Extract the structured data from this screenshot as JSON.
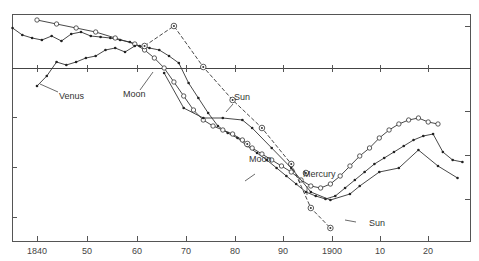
{
  "chart_data": {
    "type": "line",
    "title": "",
    "xlabel": "",
    "ylabel": "",
    "xlim": [
      1835,
      1928
    ],
    "x_ticks": [
      1840,
      1850,
      1860,
      1870,
      1880,
      1890,
      1900,
      1910,
      1920
    ],
    "x_tick_labels": [
      "1840",
      "50",
      "60",
      "70",
      "80",
      "90",
      "1900",
      "10",
      "20"
    ],
    "y_tick_labels": [],
    "grid": false,
    "reference_line": "horizontal zero line near top",
    "y_units_note": "values are relative (pixel-estimated, up = larger); y axis unlabeled",
    "series": [
      {
        "name": "Series A (dots)",
        "marker": "dot",
        "style": "solid",
        "x": [
          1835,
          1837,
          1839,
          1841,
          1843,
          1845,
          1847,
          1849,
          1851,
          1853,
          1855,
          1857,
          1859,
          1861,
          1863,
          1865,
          1867,
          1869,
          1871,
          1873,
          1875,
          1877,
          1879,
          1881,
          1883,
          1885,
          1887,
          1889,
          1891,
          1893,
          1895,
          1897,
          1899,
          1901,
          1903,
          1905,
          1907,
          1909,
          1911,
          1913,
          1915,
          1917,
          1919,
          1921,
          1923,
          1925,
          1927
        ],
        "y": [
          40,
          33,
          30,
          28,
          32,
          27,
          34,
          36,
          32,
          31,
          30,
          28,
          26,
          22,
          20,
          18,
          12,
          5,
          -15,
          -30,
          -45,
          -58,
          -65,
          -70,
          -78,
          -85,
          -92,
          -100,
          -108,
          -116,
          -124,
          -128,
          -131,
          -128,
          -120,
          -112,
          -104,
          -96,
          -90,
          -84,
          -78,
          -72,
          -68,
          -66,
          -84,
          -92,
          -94
        ]
      },
      {
        "name": "Series B (circles)",
        "marker": "circle",
        "style": "solid",
        "x": [
          1840,
          1844,
          1848,
          1852,
          1856,
          1860,
          1862,
          1864,
          1866,
          1868,
          1870,
          1872,
          1874,
          1876,
          1878,
          1880,
          1882,
          1884,
          1886,
          1888,
          1890,
          1892,
          1894,
          1896,
          1898,
          1900,
          1902,
          1904,
          1906,
          1908,
          1910,
          1912,
          1914,
          1916,
          1918,
          1920,
          1922
        ],
        "y": [
          48,
          44,
          40,
          36,
          30,
          24,
          18,
          10,
          0,
          -14,
          -28,
          -42,
          -52,
          -58,
          -62,
          -66,
          -72,
          -80,
          -86,
          -92,
          -98,
          -104,
          -112,
          -118,
          -120,
          -116,
          -108,
          -98,
          -88,
          -80,
          -70,
          -62,
          -56,
          -52,
          -50,
          -54,
          -56
        ]
      },
      {
        "name": "Venus",
        "marker": "dot",
        "style": "solid",
        "x": [
          1840,
          1842,
          1844,
          1846,
          1848,
          1850,
          1852,
          1854,
          1856,
          1858,
          1860
        ],
        "y": [
          -18,
          -8,
          6,
          3,
          6,
          10,
          12,
          18,
          20,
          16,
          22
        ]
      },
      {
        "name": "Sun (dashed, circled)",
        "marker": "circle-dot",
        "style": "dashed",
        "x": [
          1862,
          1868,
          1874,
          1880,
          1886,
          1892,
          1896,
          1900
        ],
        "y": [
          22,
          42,
          1,
          -32,
          -60,
          -96,
          -140,
          -160
        ]
      },
      {
        "name": "Sun (lower)",
        "marker": "dot",
        "style": "solid",
        "x": [
          1866,
          1870,
          1874,
          1878,
          1882,
          1884,
          1888,
          1892,
          1896,
          1900,
          1904,
          1906,
          1910,
          1914,
          1918,
          1922,
          1926
        ],
        "y": [
          -5,
          -40,
          -50,
          -50,
          -52,
          -60,
          -80,
          -100,
          -124,
          -132,
          -126,
          -118,
          -104,
          -100,
          -82,
          -98,
          -110
        ]
      },
      {
        "name": "Mercury",
        "marker": "circle-dot",
        "style": "point",
        "x": [
          1895
        ],
        "y": [
          -105
        ]
      },
      {
        "name": "Moon",
        "marker": "circle-dot",
        "style": "point",
        "x": [
          1883
        ],
        "y": [
          -76
        ]
      }
    ],
    "annotations": [
      {
        "text": "Venus",
        "x": 1844,
        "y": -28
      },
      {
        "text": "Moon",
        "x": 1861,
        "y": -28
      },
      {
        "text": "Sun",
        "x": 1877,
        "y": -20
      },
      {
        "text": "Moon",
        "x": 1883,
        "y": -66
      },
      {
        "text": "Mercury",
        "x": 1893,
        "y": -80
      },
      {
        "text": "Sun",
        "x": 1906,
        "y": -140
      }
    ]
  },
  "labels": {
    "venus": "Venus",
    "moon_upper": "Moon",
    "sun_upper": "Sun",
    "moon_lower": "Moon",
    "mercury": "Mercury",
    "sun_lower": "Sun"
  },
  "axis": {
    "t1840": "1840",
    "t50": "50",
    "t60": "60",
    "t70": "70",
    "t80": "80",
    "t90": "90",
    "t1900": "1900",
    "t10": "10",
    "t20": "20"
  }
}
